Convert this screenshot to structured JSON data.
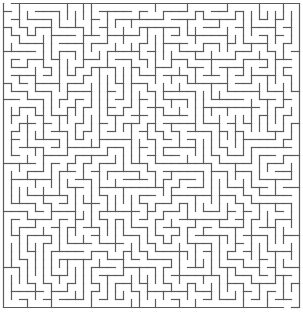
{
  "maze": {
    "title": "Maze puzzle",
    "grid": {
      "cols": 37,
      "rows": 38,
      "cell_px": 8,
      "origin_x": 3.5,
      "origin_y": 3.5
    },
    "entrance": {
      "side": "top",
      "col": 0
    },
    "exit": {
      "side": "bottom",
      "col": 35
    },
    "wall_color": "#5a5a5a",
    "background_color": "#ffffff",
    "seed": 24681
  }
}
